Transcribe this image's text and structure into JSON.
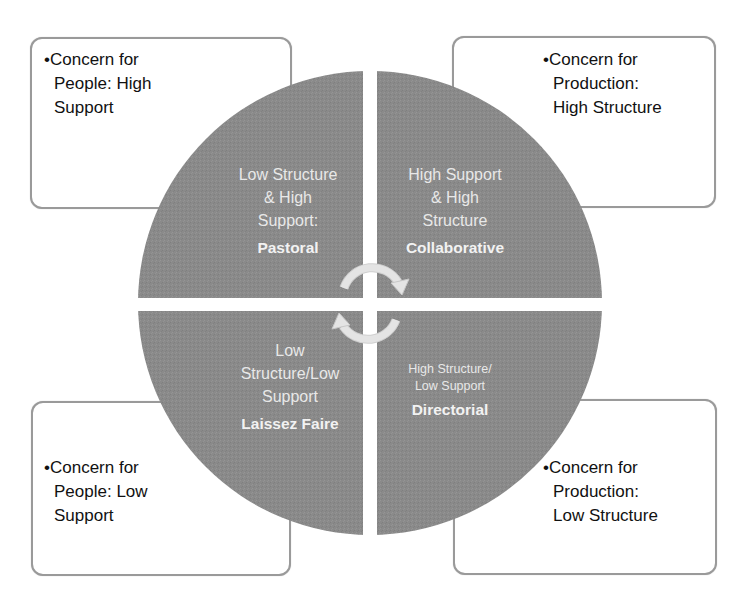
{
  "diagram": {
    "type": "quadrant-circle",
    "colors": {
      "quadrant_fill": "#8a8a8a",
      "quadrant_text": "#eeeeee",
      "box_border": "#9a9a9a",
      "box_text": "#111111",
      "background": "#ffffff",
      "arrow": "#e6e6e6"
    },
    "corner_boxes": [
      {
        "position": "top-left",
        "lines": [
          "•Concern for",
          "People: High",
          "Support"
        ]
      },
      {
        "position": "top-right",
        "lines": [
          "•Concern for",
          "Production:",
          "High Structure"
        ]
      },
      {
        "position": "bottom-left",
        "lines": [
          "•Concern for",
          "People: Low",
          "Support"
        ]
      },
      {
        "position": "bottom-right",
        "lines": [
          "•Concern for",
          "Production:",
          "Low Structure"
        ]
      }
    ],
    "quadrants": [
      {
        "position": "top-left",
        "lines": [
          "Low Structure",
          "& High",
          "Support:"
        ],
        "style": "Pastoral"
      },
      {
        "position": "top-right",
        "lines": [
          "High Support",
          "&  High",
          "Structure"
        ],
        "style": "Collaborative"
      },
      {
        "position": "bottom-left",
        "lines": [
          "Low",
          "Structure/Low",
          "Support"
        ],
        "style": "Laissez Faire"
      },
      {
        "position": "bottom-right",
        "lines": [
          "High Structure/",
          "Low Support"
        ],
        "style": "Directorial"
      }
    ],
    "center_icon": "circular-arrows-icon"
  }
}
